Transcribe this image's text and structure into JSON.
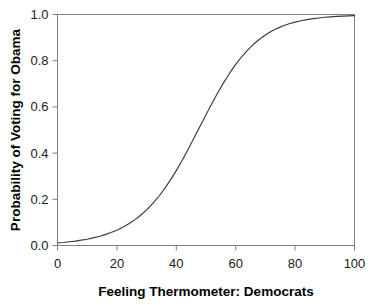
{
  "chart_data": {
    "type": "line",
    "title": "",
    "subtitle": "",
    "xlabel": "Feeling Thermometer: Democrats",
    "ylabel": "Probability of Voting for Obama",
    "xlim": [
      0,
      100
    ],
    "ylim": [
      0.0,
      1.0
    ],
    "xticks": [
      0,
      20,
      40,
      60,
      80,
      100
    ],
    "xtick_labels": [
      "0",
      "20",
      "40",
      "60",
      "80",
      "100"
    ],
    "yticks": [
      0.0,
      0.2,
      0.4,
      0.6,
      0.8,
      1.0
    ],
    "ytick_labels": [
      "0.0",
      "0.2",
      "0.4",
      "0.6",
      "0.8",
      "1.0"
    ],
    "grid": false,
    "legend": null,
    "annotations": [],
    "series": [
      {
        "name": "Predicted probability",
        "color": "#3a3a3a",
        "line_width": 1,
        "x": [
          0,
          2,
          4,
          6,
          8,
          10,
          12,
          14,
          16,
          18,
          20,
          22,
          24,
          26,
          28,
          30,
          32,
          34,
          36,
          38,
          40,
          42,
          44,
          46,
          48,
          50,
          52,
          54,
          56,
          58,
          60,
          62,
          64,
          66,
          68,
          70,
          72,
          74,
          76,
          78,
          80,
          82,
          84,
          86,
          88,
          90,
          92,
          94,
          96,
          98,
          100
        ],
        "values": [
          0.011,
          0.013,
          0.016,
          0.019,
          0.023,
          0.027,
          0.033,
          0.039,
          0.047,
          0.056,
          0.066,
          0.079,
          0.094,
          0.111,
          0.131,
          0.154,
          0.181,
          0.211,
          0.245,
          0.283,
          0.324,
          0.369,
          0.417,
          0.466,
          0.516,
          0.566,
          0.615,
          0.662,
          0.706,
          0.747,
          0.784,
          0.817,
          0.846,
          0.871,
          0.893,
          0.911,
          0.927,
          0.94,
          0.951,
          0.96,
          0.967,
          0.973,
          0.978,
          0.982,
          0.985,
          0.988,
          0.99,
          0.992,
          0.993,
          0.994,
          0.995
        ]
      }
    ]
  },
  "figure": {
    "background_color": "#ffffff",
    "frame_color": "#808080",
    "text_color": "#000000"
  }
}
